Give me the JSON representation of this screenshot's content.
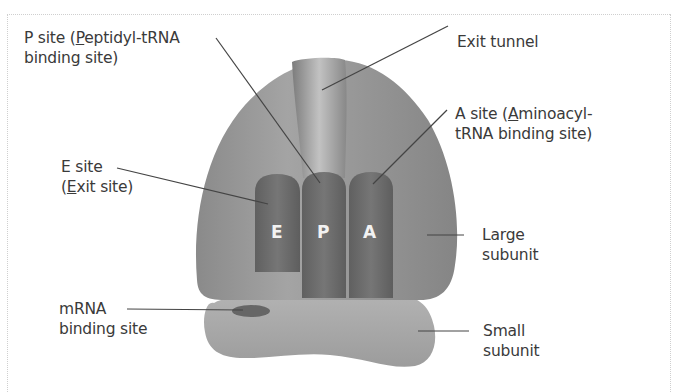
{
  "diagram": {
    "labels": {
      "p_site": {
        "line1_pre": "P site (",
        "line1_u": "P",
        "line1_post": "eptidyl-tRNA",
        "line2": "binding site)"
      },
      "exit_tunnel": {
        "text": "Exit tunnel"
      },
      "a_site": {
        "line1_pre": "A site (",
        "line1_u": "A",
        "line1_post": "minoacyl-",
        "line2": "tRNA binding site)"
      },
      "e_site": {
        "line1": "E site",
        "line2_pre": "(",
        "line2_u": "E",
        "line2_post": "xit site)"
      },
      "large_subunit": {
        "line1": "Large",
        "line2": "subunit"
      },
      "mrna_binding": {
        "line1": "mRNA",
        "line2": "binding site"
      },
      "small_subunit": {
        "line1": "Small",
        "line2": "subunit"
      }
    },
    "site_letters": {
      "e": "E",
      "p": "P",
      "a": "A"
    },
    "colors": {
      "large_subunit": "#8c8c8c",
      "small_subunit": "#a9a9a9",
      "trna": "#6e6e6e",
      "tunnel_light": "#b5b5b5",
      "mrna_site": "#6a6a6a",
      "leader_line": "#444444",
      "text": "#3a3a3a"
    }
  }
}
